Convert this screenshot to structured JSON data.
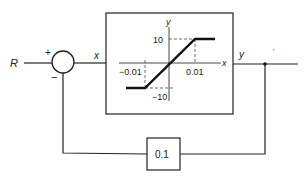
{
  "diagram": {
    "type": "block-diagram",
    "input_label": "R",
    "summing_junction": {
      "plus_sign": "+",
      "minus_sign": "−"
    },
    "signal_x_label": "x",
    "signal_y_label": "y",
    "nonlinearity_block": {
      "axis_x_label": "x",
      "axis_y_label": "y",
      "tick_pos_x": "0.01",
      "tick_neg_x": "−0.01",
      "tick_pos_y": "10",
      "tick_neg_y": "−10"
    },
    "feedback_gain": "0.1",
    "stray_mark": "'"
  }
}
